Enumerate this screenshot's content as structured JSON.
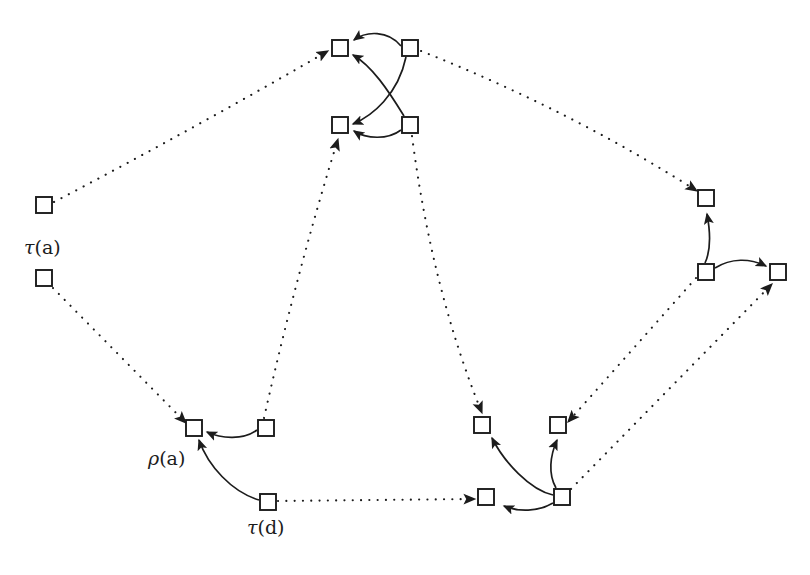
{
  "figure": {
    "background_color": "#ffffff",
    "ink_color": "#1c1c1c",
    "canvas": {
      "width": 810,
      "height": 575
    }
  },
  "labels": [
    {
      "id": "label-tau-a",
      "text": "τ(a)",
      "x": 24,
      "y": 236
    },
    {
      "id": "label-rho-a",
      "text": "ρ(a)",
      "x": 148,
      "y": 447
    },
    {
      "id": "label-tau-d",
      "text": "τ(d)",
      "x": 247,
      "y": 516
    }
  ],
  "nodes": [
    {
      "id": "n-tau-a-upper",
      "name": "node-tau-a-upper",
      "x": 36,
      "y": 197,
      "w": 16,
      "h": 16
    },
    {
      "id": "n-tau-a-lower",
      "name": "node-tau-a-lower",
      "x": 36,
      "y": 270,
      "w": 16,
      "h": 16
    },
    {
      "id": "n-top-left-1",
      "name": "node-top-left-upper",
      "x": 332,
      "y": 40,
      "w": 16,
      "h": 16
    },
    {
      "id": "n-top-left-2",
      "name": "node-top-left-lower",
      "x": 332,
      "y": 117,
      "w": 16,
      "h": 16
    },
    {
      "id": "n-top-right-1",
      "name": "node-top-right-upper",
      "x": 402,
      "y": 40,
      "w": 16,
      "h": 16
    },
    {
      "id": "n-top-right-2",
      "name": "node-top-right-lower",
      "x": 402,
      "y": 117,
      "w": 16,
      "h": 16
    },
    {
      "id": "n-right-upper",
      "name": "node-right-upper",
      "x": 698,
      "y": 190,
      "w": 16,
      "h": 16
    },
    {
      "id": "n-right-mid",
      "name": "node-right-middle",
      "x": 698,
      "y": 264,
      "w": 16,
      "h": 16
    },
    {
      "id": "n-right-far",
      "name": "node-right-far",
      "x": 770,
      "y": 264,
      "w": 16,
      "h": 16
    },
    {
      "id": "n-rho-a",
      "name": "node-rho-a",
      "x": 186,
      "y": 420,
      "w": 16,
      "h": 16
    },
    {
      "id": "n-bl-right",
      "name": "node-bottom-left-right",
      "x": 258,
      "y": 420,
      "w": 16,
      "h": 16
    },
    {
      "id": "n-tau-d",
      "name": "node-tau-d",
      "x": 260,
      "y": 494,
      "w": 16,
      "h": 16
    },
    {
      "id": "n-br-tl",
      "name": "node-bottom-right-top-left",
      "x": 474,
      "y": 417,
      "w": 16,
      "h": 16
    },
    {
      "id": "n-br-tr",
      "name": "node-bottom-right-top-right",
      "x": 550,
      "y": 417,
      "w": 16,
      "h": 16
    },
    {
      "id": "n-br-bl",
      "name": "node-bottom-right-bottom-left",
      "x": 478,
      "y": 489,
      "w": 16,
      "h": 16
    },
    {
      "id": "n-br-br",
      "name": "node-bottom-right-bottom-right",
      "x": 554,
      "y": 489,
      "w": 16,
      "h": 16
    }
  ],
  "edges_dotted": [
    {
      "id": "e-d1",
      "name": "dotted-edge-tau-a-upper-to-top-left-upper",
      "from": "n-tau-a-upper",
      "to": "n-top-left-1",
      "d": "M 54 202 Q 195 128 328 51"
    },
    {
      "id": "e-d2",
      "name": "dotted-edge-tau-a-lower-to-rho-a",
      "from": "n-tau-a-lower",
      "to": "n-rho-a",
      "d": "M 53 288 L 186 423"
    },
    {
      "id": "e-d3",
      "name": "dotted-edge-bottom-left-right-to-top-left-lower",
      "from": "n-bl-right",
      "to": "n-top-left-2",
      "d": "M 264 418 Q 296 275 338 139"
    },
    {
      "id": "e-d4",
      "name": "dotted-edge-top-right-upper-to-right-upper",
      "from": "n-top-right-1",
      "to": "n-right-upper",
      "d": "M 421 51 Q 570 110 697 191"
    },
    {
      "id": "e-d5",
      "name": "dotted-edge-top-right-lower-to-bottom-right-top-left",
      "from": "n-top-right-2",
      "to": "n-br-tl",
      "d": "M 412 136 Q 432 290 482 413"
    },
    {
      "id": "e-d6",
      "name": "dotted-edge-right-middle-to-bottom-right-top-right",
      "from": "n-right-mid",
      "to": "n-br-tr",
      "d": "M 696 278 L 568 422"
    },
    {
      "id": "e-d7",
      "name": "dotted-edge-bottom-right-bottom-right-to-right-far",
      "from": "n-br-br",
      "to": "n-right-far",
      "d": "M 571 489 L 772 284"
    },
    {
      "id": "e-d8",
      "name": "dotted-edge-tau-d-to-bottom-right-bottom-left",
      "from": "n-tau-d",
      "to": "n-br-bl",
      "d": "M 278 501 L 475 499"
    }
  ],
  "edges_solid": [
    {
      "id": "e-s1",
      "name": "curved-arrow-top-right-upper-to-top-left-upper",
      "from": "n-top-right-1",
      "to": "n-top-left-1",
      "d": "M 401 46 C 388 30 366 31 354 40"
    },
    {
      "id": "e-s2",
      "name": "curved-arrow-top-right-upper-to-top-left-lower",
      "from": "n-top-right-1",
      "to": "n-top-left-2",
      "d": "M 406 57 C 398 95 372 116 353 124"
    },
    {
      "id": "e-s3",
      "name": "curved-arrow-top-right-lower-to-top-left-upper",
      "from": "n-top-right-2",
      "to": "n-top-left-1",
      "d": "M 404 116 C 388 90 372 66 353 55"
    },
    {
      "id": "e-s4",
      "name": "curved-arrow-top-right-lower-to-top-left-lower",
      "from": "n-top-right-2",
      "to": "n-top-left-2",
      "d": "M 401 130 C 388 140 366 139 354 131"
    },
    {
      "id": "e-s5",
      "name": "curved-arrow-right-middle-to-right-upper",
      "from": "n-right-mid",
      "to": "n-right-upper",
      "d": "M 705 263 C 712 248 710 230 707 214"
    },
    {
      "id": "e-s6",
      "name": "curved-arrow-right-middle-to-right-far",
      "from": "n-right-mid",
      "to": "n-right-far",
      "d": "M 715 268 C 731 258 750 258 766 266"
    },
    {
      "id": "e-s7",
      "name": "curved-arrow-bottom-left-right-to-rho-a",
      "from": "n-bl-right",
      "to": "n-rho-a",
      "d": "M 257 430 C 243 440 222 439 207 432"
    },
    {
      "id": "e-s8",
      "name": "curved-arrow-tau-d-to-rho-a",
      "from": "n-tau-d",
      "to": "n-rho-a",
      "d": "M 259 500 C 232 492 208 466 199 440"
    },
    {
      "id": "e-s9",
      "name": "curved-arrow-bottom-right-bottom-right-to-top-left",
      "from": "n-br-br",
      "to": "n-br-tl",
      "d": "M 553 495 C 530 490 504 462 492 438"
    },
    {
      "id": "e-s10",
      "name": "curved-arrow-bottom-right-bottom-right-to-top-right",
      "from": "n-br-br",
      "to": "n-br-tr",
      "d": "M 556 488 C 548 474 550 456 557 440"
    },
    {
      "id": "e-s11",
      "name": "curved-arrow-bottom-right-bottom-right-to-bottom-left",
      "from": "n-br-br",
      "to": "n-br-bl",
      "d": "M 553 503 C 538 512 518 512 504 506"
    }
  ]
}
